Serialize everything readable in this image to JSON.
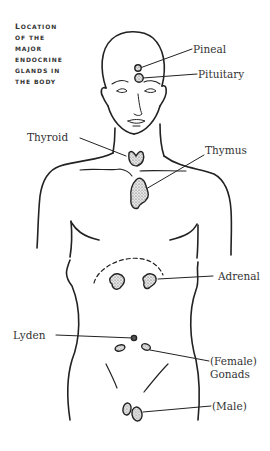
{
  "title": {
    "lines": [
      "Location",
      "of the",
      "major",
      "endocrine",
      "glands in",
      "the body"
    ]
  },
  "labels": {
    "pineal": "Pineal",
    "pituitary": "Pituitary",
    "thyroid": "Thyroid",
    "thymus": "Thymus",
    "adrenal": "Adrenal",
    "lyden": "Lyden",
    "female": "(Female)",
    "gonads": "Gonads",
    "male": "(Male)"
  },
  "colors": {
    "ink": "#222222",
    "gland_fill": "#c8c8c8",
    "background": "#ffffff"
  }
}
